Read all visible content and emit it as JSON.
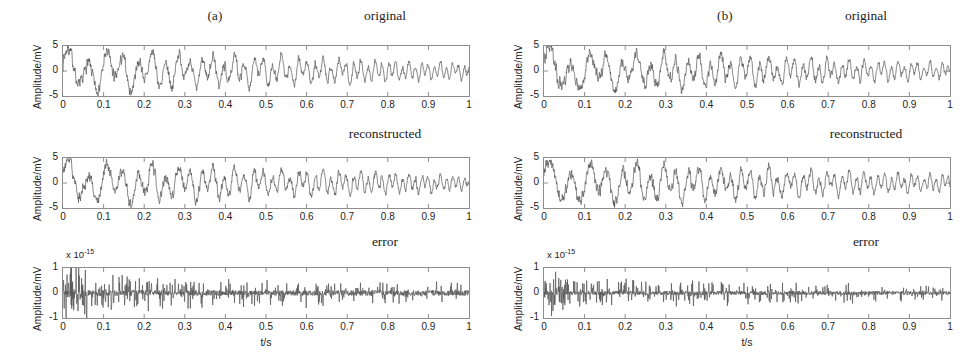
{
  "figure": {
    "panels": [
      {
        "id": "a",
        "letter": "(a)",
        "subplots": [
          {
            "id": "a-original",
            "title": "original",
            "ylabel": "Amplitude/mV",
            "exponent": null,
            "yticks": [
              "5",
              "0",
              "-5"
            ],
            "xticks": [
              "0",
              "0.1",
              "0.2",
              "0.3",
              "0.4",
              "0.5",
              "0.6",
              "0.7",
              "0.8",
              "0.9",
              "1"
            ],
            "xlabel": null
          },
          {
            "id": "a-reconstructed",
            "title": "reconstructed",
            "ylabel": "Amplitude/mV",
            "exponent": null,
            "yticks": [
              "5",
              "0",
              "-5"
            ],
            "xticks": [
              "0",
              "0.1",
              "0.2",
              "0.3",
              "0.4",
              "0.5",
              "0.6",
              "0.7",
              "0.8",
              "0.9",
              "1"
            ],
            "xlabel": null
          },
          {
            "id": "a-error",
            "title": "error",
            "ylabel": "Amplitude/mV",
            "exponent": "x 10",
            "exponent_power": "-15",
            "yticks": [
              "1",
              "0",
              "-1"
            ],
            "xticks": [
              "0",
              "0.1",
              "0.2",
              "0.3",
              "0.4",
              "0.5",
              "0.6",
              "0.7",
              "0.8",
              "0.9",
              "1"
            ],
            "xlabel": "t/s"
          }
        ]
      },
      {
        "id": "b",
        "letter": "(b)",
        "subplots": [
          {
            "id": "b-original",
            "title": "original",
            "ylabel": "Amplitude/mV",
            "exponent": null,
            "yticks": [
              "5",
              "0",
              "-5"
            ],
            "xticks": [
              "0",
              "0.1",
              "0.2",
              "0.3",
              "0.4",
              "0.5",
              "0.6",
              "0.7",
              "0.8",
              "0.9",
              "1"
            ],
            "xlabel": null
          },
          {
            "id": "b-reconstructed",
            "title": "reconstructed",
            "ylabel": "Amplitude/mV",
            "exponent": null,
            "yticks": [
              "5",
              "0",
              "-5"
            ],
            "xticks": [
              "0",
              "0.1",
              "0.2",
              "0.3",
              "0.4",
              "0.5",
              "0.6",
              "0.7",
              "0.8",
              "0.9",
              "1"
            ],
            "xlabel": null
          },
          {
            "id": "b-error",
            "title": "error",
            "ylabel": "Amplitude/mV",
            "exponent": "x 10",
            "exponent_power": "-15",
            "yticks": [
              "1",
              "0",
              "-1"
            ],
            "xticks": [
              "0",
              "0.1",
              "0.2",
              "0.3",
              "0.4",
              "0.5",
              "0.6",
              "0.7",
              "0.8",
              "0.9",
              "1"
            ],
            "xlabel": "t/s"
          }
        ]
      }
    ]
  },
  "style": {
    "trace_color": "#555555",
    "axis_color": "#8e8e8e"
  },
  "chart_data": [
    {
      "id": "a-original",
      "type": "line",
      "title": "original",
      "xlabel": "",
      "ylabel": "Amplitude/mV",
      "xlim": [
        0,
        1
      ],
      "ylim": [
        -5,
        5
      ],
      "xticks": [
        0,
        0.1,
        0.2,
        0.3,
        0.4,
        0.5,
        0.6,
        0.7,
        0.8,
        0.9,
        1
      ],
      "yticks": [
        -5,
        0,
        5
      ],
      "grid": false,
      "legend": "none",
      "series": [
        {
          "name": "original signal",
          "description": "noisy chirp: amplitude decays from about 3 mV near t=0 to about 1 mV near t=1 while instantaneous frequency sweeps upward",
          "envelope_start": 3.0,
          "envelope_end": 1.0,
          "freq_start_hz": 18,
          "freq_end_hz": 70,
          "noise_level": 0.45
        }
      ]
    },
    {
      "id": "a-reconstructed",
      "type": "line",
      "title": "reconstructed",
      "xlabel": "",
      "ylabel": "Amplitude/mV",
      "xlim": [
        0,
        1
      ],
      "ylim": [
        -5,
        5
      ],
      "xticks": [
        0,
        0.1,
        0.2,
        0.3,
        0.4,
        0.5,
        0.6,
        0.7,
        0.8,
        0.9,
        1
      ],
      "yticks": [
        -5,
        0,
        5
      ],
      "grid": false,
      "legend": "none",
      "series": [
        {
          "name": "reconstructed signal",
          "description": "visually identical to the original trace",
          "envelope_start": 3.0,
          "envelope_end": 1.0,
          "freq_start_hz": 18,
          "freq_end_hz": 70,
          "noise_level": 0.45
        }
      ]
    },
    {
      "id": "a-error",
      "type": "line",
      "title": "error",
      "xlabel": "t/s",
      "ylabel": "Amplitude/mV",
      "exponent": "x 10^-15",
      "xlim": [
        0,
        1
      ],
      "ylim": [
        -1,
        1
      ],
      "xticks": [
        0,
        0.1,
        0.2,
        0.3,
        0.4,
        0.5,
        0.6,
        0.7,
        0.8,
        0.9,
        1
      ],
      "yticks": [
        -1,
        0,
        1
      ],
      "grid": false,
      "legend": "none",
      "series": [
        {
          "name": "reconstruction error",
          "description": "near-zero residual of order 1e-15 mV with sparse spikes reaching about +/-0.6 of full scale, densest for t < 0.35",
          "typical_abs": 0.12,
          "max_abs": 0.7,
          "noise_level": 0.12
        }
      ]
    },
    {
      "id": "b-original",
      "type": "line",
      "title": "original",
      "xlabel": "",
      "ylabel": "Amplitude/mV",
      "xlim": [
        0,
        1
      ],
      "ylim": [
        -5,
        5
      ],
      "xticks": [
        0,
        0.1,
        0.2,
        0.3,
        0.4,
        0.5,
        0.6,
        0.7,
        0.8,
        0.9,
        1
      ],
      "yticks": [
        -5,
        0,
        5
      ],
      "grid": false,
      "legend": "none",
      "series": [
        {
          "name": "original signal",
          "description": "noisy chirp similar to panel (a), amplitude about 3 mV falling to about 1 mV, frequency sweeping upward",
          "envelope_start": 3.1,
          "envelope_end": 1.1,
          "freq_start_hz": 17,
          "freq_end_hz": 68,
          "noise_level": 0.45
        }
      ]
    },
    {
      "id": "b-reconstructed",
      "type": "line",
      "title": "reconstructed",
      "xlabel": "",
      "ylabel": "Amplitude/mV",
      "xlim": [
        0,
        1
      ],
      "ylim": [
        -5,
        5
      ],
      "xticks": [
        0,
        0.1,
        0.2,
        0.3,
        0.4,
        0.5,
        0.6,
        0.7,
        0.8,
        0.9,
        1
      ],
      "yticks": [
        -5,
        0,
        5
      ],
      "grid": false,
      "legend": "none",
      "series": [
        {
          "name": "reconstructed signal",
          "description": "visually identical to the original trace",
          "envelope_start": 3.1,
          "envelope_end": 1.1,
          "freq_start_hz": 17,
          "freq_end_hz": 68,
          "noise_level": 0.45
        }
      ]
    },
    {
      "id": "b-error",
      "type": "line",
      "title": "error",
      "xlabel": "t/s",
      "ylabel": "Amplitude/mV",
      "exponent": "x 10^-15",
      "xlim": [
        0,
        1
      ],
      "ylim": [
        -1,
        1
      ],
      "xticks": [
        0,
        0.1,
        0.2,
        0.3,
        0.4,
        0.5,
        0.6,
        0.7,
        0.8,
        0.9,
        1
      ],
      "yticks": [
        -1,
        0,
        1
      ],
      "grid": false,
      "legend": "none",
      "series": [
        {
          "name": "reconstruction error",
          "description": "near-zero residual of order 1e-15 mV, sparser than panel (a), largest spikes about +/-0.5 of full scale near t=0.03",
          "typical_abs": 0.09,
          "max_abs": 0.55,
          "noise_level": 0.09
        }
      ]
    }
  ]
}
